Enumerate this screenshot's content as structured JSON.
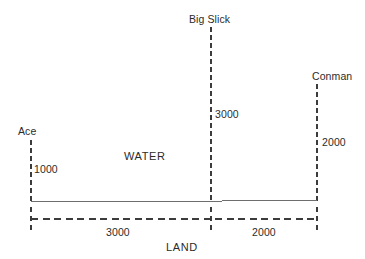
{
  "diagram": {
    "zones": {
      "water_label": "WATER",
      "land_label": "LAND"
    },
    "wells": [
      {
        "name": "Ace",
        "depth_label": "1000",
        "x": 31,
        "top_y": 140,
        "bottom_y": 201
      },
      {
        "name": "Big Slick",
        "depth_label": "3000",
        "x": 211,
        "top_y": 27,
        "bottom_y": 201
      },
      {
        "name": "Conman",
        "depth_label": "2000",
        "x": 317,
        "top_y": 84,
        "bottom_y": 201
      }
    ],
    "spans": [
      {
        "label": "3000",
        "from": "Ace",
        "to": "Big Slick"
      },
      {
        "label": "2000",
        "from": "Big Slick",
        "to": "Conman"
      }
    ],
    "surface_line": {
      "y": 201,
      "x_start": 31,
      "x_end": 317
    },
    "dimension_line": {
      "y": 219,
      "x_start": 31,
      "x_end": 317,
      "ticks": [
        31,
        211,
        317
      ]
    },
    "colors": {
      "line": "#3c3c3c",
      "surface": "#6e6e6e",
      "text": "#2b2b2b",
      "background": "#ffffff"
    }
  }
}
